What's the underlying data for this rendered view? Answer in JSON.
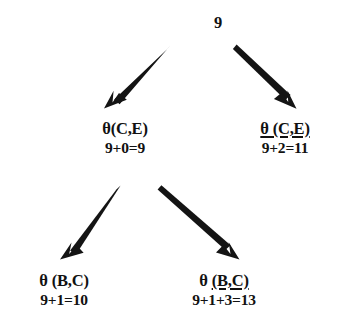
{
  "diagram": {
    "type": "search-tree",
    "title": "",
    "background_color": "#ffffff",
    "ink_color": "#111111",
    "nodes": [
      {
        "id": "root",
        "label": "9",
        "cost": "",
        "underline": "none",
        "x": 218,
        "y": 14
      },
      {
        "id": "mid-left",
        "label": "θ(C,E)",
        "cost": "9+0=9",
        "underline": "none",
        "x": 125,
        "y": 120
      },
      {
        "id": "mid-right",
        "label": "θ (C,E)",
        "cost": "9+2=11",
        "underline": "full",
        "x": 285,
        "y": 120
      },
      {
        "id": "leaf-left",
        "label": "θ (B,C)",
        "cost": "9+1=10",
        "underline": "none",
        "x": 64,
        "y": 272
      },
      {
        "id": "leaf-right",
        "label_prefix": "θ ",
        "label_underlined": "(B,C)",
        "label": "θ (B,C)",
        "cost": "9+1+3=13",
        "underline": "partial",
        "x": 224,
        "y": 272
      }
    ],
    "edges": [
      {
        "id": "root-to-mid-left",
        "from": "root",
        "to": "mid-left",
        "x1": 170,
        "y1": 46,
        "x2": 106,
        "y2": 106
      },
      {
        "id": "root-to-mid-right",
        "from": "root",
        "to": "mid-right",
        "x1": 238,
        "y1": 46,
        "x2": 296,
        "y2": 106
      },
      {
        "id": "mid-left-to-leaf-left",
        "from": "mid-left",
        "to": "leaf-left",
        "x1": 119,
        "y1": 187,
        "x2": 62,
        "y2": 258
      },
      {
        "id": "mid-left-to-leaf-right",
        "from": "mid-left",
        "to": "leaf-right",
        "x1": 163,
        "y1": 187,
        "x2": 238,
        "y2": 258
      }
    ]
  }
}
